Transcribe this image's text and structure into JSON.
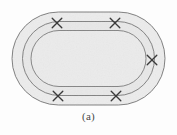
{
  "figure": {
    "caption": "(a)",
    "kind": "physics-diagram",
    "background_color": "#fdfdfd",
    "fill_color": "#ececec",
    "band_fill_color": "#e6e6e6",
    "inner_fill_color": "#ebebeb",
    "stroke_color": "#6e6e6e",
    "marker_color": "#3a3a3a",
    "loops": [
      {
        "name": "outer-loop",
        "cx": 88.5,
        "cy": 58.5,
        "half_width": 76.5,
        "half_height": 46.5,
        "corner_radius": 46.5
      },
      {
        "name": "middle-loop",
        "cx": 88.5,
        "cy": 58.5,
        "half_width": 66.0,
        "half_height": 37.0,
        "corner_radius": 37.0
      },
      {
        "name": "inner-loop",
        "cx": 88.5,
        "cy": 58.5,
        "half_width": 57.5,
        "half_height": 28.0,
        "corner_radius": 28.0
      }
    ],
    "markers": [
      {
        "name": "cross-marker-top-left",
        "x": 57,
        "y": 23,
        "size": 11
      },
      {
        "name": "cross-marker-top-right",
        "x": 115,
        "y": 23,
        "size": 11
      },
      {
        "name": "cross-marker-right",
        "x": 152,
        "y": 60,
        "size": 11
      },
      {
        "name": "cross-marker-bottom-left",
        "x": 58,
        "y": 96,
        "size": 11
      },
      {
        "name": "cross-marker-bottom-right",
        "x": 116,
        "y": 96,
        "size": 11
      }
    ]
  }
}
